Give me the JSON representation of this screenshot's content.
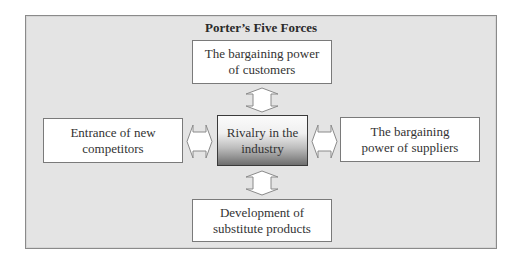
{
  "diagram": {
    "title": "Porter’s Five Forces",
    "center": {
      "line1": "Rivalry in the",
      "line2": "industry"
    },
    "top": {
      "line1": "The bargaining power",
      "line2": "of customers"
    },
    "left": {
      "line1": "Entrance of new",
      "line2": "competitors"
    },
    "right": {
      "line1": "The bargaining",
      "line2": "power of suppliers"
    },
    "bottom": {
      "line1": "Development of",
      "line2": "substitute products"
    },
    "arrows": [
      "double-arrow-vertical-top",
      "double-arrow-horizontal-left",
      "double-arrow-horizontal-right",
      "double-arrow-vertical-bottom"
    ],
    "colors": {
      "frame_bg": "#e4e4e4",
      "frame_border": "#8a8a8a",
      "box_bg": "#ffffff",
      "center_gradient_dark": "#6e6e6e"
    }
  }
}
